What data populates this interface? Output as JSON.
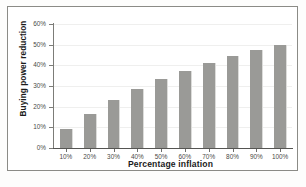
{
  "chart_data": {
    "type": "bar",
    "title": "",
    "xlabel": "Percentage inflation",
    "ylabel": "Buying power reduction",
    "categories": [
      "10%",
      "20%",
      "30%",
      "40%",
      "50%",
      "60%",
      "70%",
      "80%",
      "90%",
      "100%"
    ],
    "values": [
      9.1,
      16.7,
      23.1,
      28.6,
      33.3,
      37.5,
      41.2,
      44.4,
      47.4,
      50.0
    ],
    "value_labels": [
      "9.1%",
      "16.7%",
      "23.1%",
      "28.6%",
      "33.3%",
      "37.5%",
      "41.2%",
      "44.4%",
      "47.4%",
      "50.0%"
    ],
    "ylim": [
      0,
      60
    ],
    "ytick_labels": [
      "0%",
      "10%",
      "20%",
      "30%",
      "40%",
      "50%",
      "60%"
    ],
    "ytick_values": [
      0,
      10,
      20,
      30,
      40,
      50,
      60
    ],
    "grid": true,
    "legend": false,
    "bar_color": "#9a9a97",
    "axis_color": "#7c7c78",
    "grid_color": "#efefee",
    "frame_color": "#8b8b86",
    "text_color": "#1b1b1b"
  }
}
